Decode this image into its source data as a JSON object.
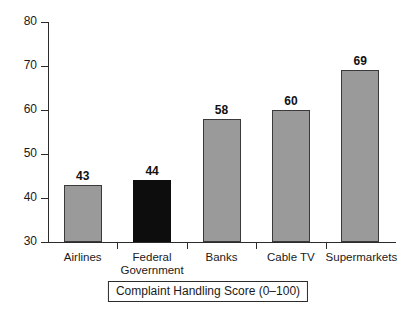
{
  "chart_data": {
    "type": "bar",
    "title": "",
    "subtitle": "",
    "xlabel": "Complaint Handling Score (0–100)",
    "ylabel": "",
    "categories": [
      "Airlines",
      "Federal\nGovernment",
      "Banks",
      "Cable TV",
      "Supermarkets"
    ],
    "values": [
      43,
      44,
      58,
      60,
      69
    ],
    "value_labels": [
      "43",
      "44",
      "58",
      "60",
      "69"
    ],
    "ylim": [
      30,
      80
    ],
    "yticks": [
      30,
      40,
      50,
      60,
      70,
      80
    ],
    "ytick_labels": [
      "30",
      "40",
      "50",
      "60",
      "70",
      "80"
    ],
    "grid": false,
    "legend": "none",
    "bar_colors": [
      "#9a9a9a",
      "#0d0d0d",
      "#9a9a9a",
      "#9a9a9a",
      "#9a9a9a"
    ],
    "highlight_category": "Federal Government",
    "colors": {
      "bar_gray": "#9a9a9a",
      "bar_highlight": "#0d0d0d",
      "axis": "#2b2b2b",
      "text": "#1a1a1a",
      "background": "#ffffff"
    }
  }
}
